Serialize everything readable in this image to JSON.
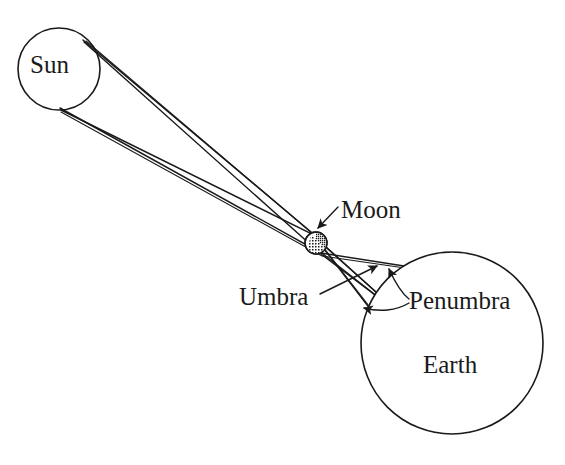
{
  "figure": {
    "width": 565,
    "height": 465,
    "background_color": "#ffffff",
    "stroke_color": "#1a1a1a"
  },
  "labels": {
    "sun": "Sun",
    "moon": "Moon",
    "umbra": "Umbra",
    "penumbra": "Penumbra",
    "earth": "Earth"
  },
  "bodies": {
    "sun": {
      "name": "Sun",
      "cx": 59,
      "cy": 69,
      "r": 41,
      "fill": "none",
      "stroke": "#1a1a1a"
    },
    "moon": {
      "name": "Moon",
      "cx": 316,
      "cy": 243,
      "r": 11,
      "fill": "stipple",
      "stroke": "#1a1a1a"
    },
    "earth": {
      "name": "Earth",
      "cx": 452,
      "cy": 343,
      "r": 91,
      "fill": "none",
      "stroke": "#1a1a1a"
    }
  },
  "rays": {
    "sun_tangent_top": {
      "x": 83,
      "y": 40
    },
    "sun_tangent_bottom": {
      "x": 60,
      "y": 108
    },
    "moon_tangent_top": {
      "x": 311,
      "y": 232
    },
    "moon_tangent_bottom": {
      "x": 321,
      "y": 254
    },
    "umbra_apex": {
      "x": 396,
      "y": 310
    },
    "penumbra_upper_hit": {
      "x": 404,
      "y": 266
    },
    "penumbra_lower_hit": {
      "x": 381,
      "y": 323
    },
    "crossing_point": {
      "x": 252,
      "y": 203
    }
  },
  "leaders": {
    "moon": {
      "from": {
        "x": 338,
        "y": 207
      },
      "to": {
        "x": 318,
        "y": 228
      }
    },
    "umbra": {
      "from": {
        "x": 320,
        "y": 294
      },
      "to": {
        "x": 377,
        "y": 266
      }
    },
    "penumbra_up": {
      "from": {
        "x": 410,
        "y": 300
      },
      "to": {
        "x": 389,
        "y": 268
      }
    },
    "penumbra_down": {
      "from": {
        "x": 410,
        "y": 304
      },
      "to": {
        "x": 363,
        "y": 308
      }
    }
  }
}
